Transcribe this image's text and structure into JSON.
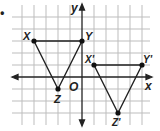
{
  "bullet": "•",
  "axes": {
    "x_label": "x",
    "y_label": "y",
    "origin_label": "O"
  },
  "grid": {
    "origin_px": [
      82,
      77
    ],
    "unit_px": 12,
    "x_range": [
      -5,
      6
    ],
    "y_range": [
      -3,
      5
    ]
  },
  "triangle_original": {
    "points": [
      {
        "name": "X",
        "label": "X",
        "coord": [
          -4,
          3
        ]
      },
      {
        "name": "Y",
        "label": "Y",
        "coord": [
          0,
          3
        ]
      },
      {
        "name": "Z",
        "label": "Z",
        "coord": [
          -2,
          -1
        ]
      }
    ]
  },
  "triangle_image": {
    "points": [
      {
        "name": "X'",
        "label": "X'",
        "coord": [
          1,
          1
        ]
      },
      {
        "name": "Y'",
        "label": "Y'",
        "coord": [
          5,
          1
        ]
      },
      {
        "name": "Z'",
        "label": "Z'",
        "coord": [
          3,
          -3
        ]
      }
    ]
  },
  "colors": {
    "grid": "#bbbbbb",
    "axis": "#222222",
    "shape": "#222222"
  }
}
